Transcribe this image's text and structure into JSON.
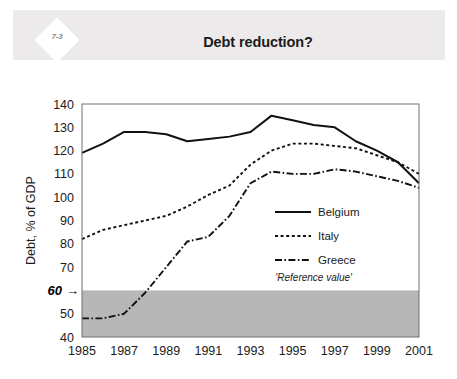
{
  "slide": {
    "badge": "7-3",
    "title": "Debt reduction?",
    "background_color": "#ffffff",
    "header_color": "#eceaea"
  },
  "chart_data": {
    "type": "line",
    "title": "Debt reduction?",
    "xlabel": "",
    "ylabel": "Debt, % of GDP",
    "xlim": [
      1985,
      2001
    ],
    "ylim": [
      40,
      140
    ],
    "ytick_step": 10,
    "grid": false,
    "legend_position": "center-right",
    "x": [
      1985,
      1986,
      1987,
      1988,
      1989,
      1990,
      1991,
      1992,
      1993,
      1994,
      1995,
      1996,
      1997,
      1998,
      1999,
      2000,
      2001
    ],
    "xticks": [
      1985,
      1987,
      1989,
      1991,
      1993,
      1995,
      1997,
      1999,
      2001
    ],
    "yticks": [
      40,
      50,
      60,
      70,
      80,
      90,
      100,
      110,
      120,
      130,
      140
    ],
    "series": [
      {
        "name": "Belgium",
        "style": "solid",
        "color": "#111111",
        "values": [
          119,
          123,
          128,
          128,
          127,
          124,
          125,
          126,
          128,
          135,
          133,
          131,
          130,
          124,
          120,
          115,
          106
        ]
      },
      {
        "name": "Italy",
        "style": "dotted",
        "color": "#111111",
        "values": [
          82,
          86,
          88,
          90,
          92,
          96,
          101,
          105,
          114,
          120,
          123,
          123,
          122,
          121,
          118,
          115,
          110
        ]
      },
      {
        "name": "Greece",
        "style": "dashdot",
        "color": "#111111",
        "values": [
          48,
          48,
          50,
          59,
          70,
          81,
          83,
          92,
          106,
          111,
          110,
          110,
          112,
          111,
          109,
          107,
          104
        ]
      }
    ],
    "annotations": [
      {
        "name": "reference-value-label",
        "text": "'Reference value'",
        "x": 1996,
        "y": 64
      },
      {
        "name": "reference-value-callout",
        "text": "60",
        "y": 60,
        "arrow": "→"
      }
    ],
    "shaded_region": {
      "from": 40,
      "to": 60,
      "color": "#b7b7b7",
      "label": "'Reference value'"
    }
  },
  "legend": {
    "items": [
      {
        "label": "Belgium",
        "style": "solid"
      },
      {
        "label": "Italy",
        "style": "dotted"
      },
      {
        "label": "Greece",
        "style": "dashdot"
      }
    ]
  }
}
